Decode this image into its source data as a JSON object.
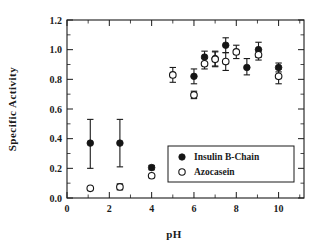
{
  "chart_data": {
    "type": "scatter",
    "title": "",
    "xlabel": "pH",
    "ylabel": "Specific Activity",
    "xlim": [
      0,
      11.2
    ],
    "ylim": [
      0.0,
      1.2
    ],
    "grid": false,
    "legend_position": "inside-lower-right",
    "x_ticks": [
      0,
      2,
      4,
      6,
      8,
      10
    ],
    "x_tick_labels": [
      "0",
      "2",
      "4",
      "6",
      "8",
      "10"
    ],
    "x_minor_ticks": [
      1,
      3,
      5,
      7,
      9,
      11
    ],
    "y_ticks": [
      0.0,
      0.2,
      0.4,
      0.6,
      0.8,
      1.0,
      1.2
    ],
    "y_tick_labels": [
      "0.0",
      "0.2",
      "0.4",
      "0.6",
      "0.8",
      "1.0",
      "1.2"
    ],
    "y_minor_ticks": [
      0.1,
      0.3,
      0.5,
      0.7,
      0.9,
      1.1
    ],
    "series": [
      {
        "name": "Insulin B-Chain",
        "marker": "filled-circle",
        "color": "#151515",
        "points": [
          {
            "x": 1.1,
            "y": 0.37,
            "err_low": 0.17,
            "err_high": 0.16
          },
          {
            "x": 2.5,
            "y": 0.37,
            "err_low": 0.16,
            "err_high": 0.16
          },
          {
            "x": 4.0,
            "y": 0.205,
            "err_low": 0.015,
            "err_high": 0.015
          },
          {
            "x": 6.0,
            "y": 0.82,
            "err_low": 0.05,
            "err_high": 0.05
          },
          {
            "x": 6.5,
            "y": 0.95,
            "err_low": 0.04,
            "err_high": 0.04
          },
          {
            "x": 7.0,
            "y": 0.94,
            "err_low": 0.05,
            "err_high": 0.05
          },
          {
            "x": 7.5,
            "y": 1.03,
            "err_low": 0.05,
            "err_high": 0.05
          },
          {
            "x": 8.5,
            "y": 0.88,
            "err_low": 0.05,
            "err_high": 0.06
          },
          {
            "x": 9.05,
            "y": 1.0,
            "err_low": 0.05,
            "err_high": 0.05
          },
          {
            "x": 10.0,
            "y": 0.88,
            "err_low": 0.03,
            "err_high": 0.03
          }
        ]
      },
      {
        "name": "Azocasein",
        "marker": "open-circle",
        "color": "#151515",
        "points": [
          {
            "x": 1.1,
            "y": 0.065,
            "err_low": 0.0,
            "err_high": 0.0
          },
          {
            "x": 2.5,
            "y": 0.075,
            "err_low": 0.02,
            "err_high": 0.02
          },
          {
            "x": 4.0,
            "y": 0.15,
            "err_low": 0.0,
            "err_high": 0.0
          },
          {
            "x": 5.0,
            "y": 0.83,
            "err_low": 0.05,
            "err_high": 0.05
          },
          {
            "x": 6.0,
            "y": 0.695,
            "err_low": 0.025,
            "err_high": 0.025
          },
          {
            "x": 6.5,
            "y": 0.905,
            "err_low": 0.035,
            "err_high": 0.035
          },
          {
            "x": 7.0,
            "y": 0.935,
            "err_low": 0.05,
            "err_high": 0.05
          },
          {
            "x": 7.5,
            "y": 0.92,
            "err_low": 0.06,
            "err_high": 0.06
          },
          {
            "x": 8.0,
            "y": 0.985,
            "err_low": 0.045,
            "err_high": 0.045
          },
          {
            "x": 9.05,
            "y": 0.965,
            "err_low": 0.035,
            "err_high": 0.035
          },
          {
            "x": 10.0,
            "y": 0.82,
            "err_low": 0.05,
            "err_high": 0.05
          }
        ]
      }
    ],
    "legend": [
      {
        "label": "Insulin B-Chain",
        "marker": "filled-circle"
      },
      {
        "label": "Azocasein",
        "marker": "open-circle"
      }
    ]
  }
}
